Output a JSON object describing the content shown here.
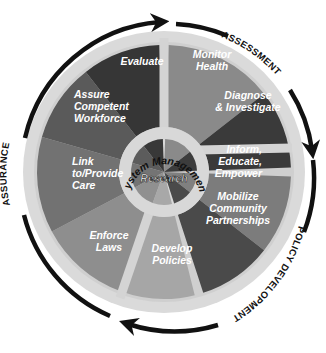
{
  "diagram": {
    "center_x": 164,
    "center_y": 172,
    "hub": {
      "inner_label": "Research",
      "ring_label": "System Management"
    },
    "phases": [
      {
        "name": "assessment",
        "label": "ASSESSMENT"
      },
      {
        "name": "policy-development",
        "label": "POLICY DEVELOPMENT"
      },
      {
        "name": "assurance",
        "label": "ASSURANCE"
      }
    ],
    "services": [
      {
        "id": "monitor-health",
        "lines": [
          "Monitor",
          "Health"
        ],
        "color": "#8a8a8a"
      },
      {
        "id": "diagnose-investigate",
        "lines": [
          "Diagnose",
          "& Investigate"
        ],
        "color": "#3a3a3a"
      },
      {
        "id": "inform-educate-empower",
        "lines": [
          "Inform,",
          "Educate,",
          "Empower"
        ],
        "color": "#7c7c7c"
      },
      {
        "id": "mobilize-community-partnerships",
        "lines": [
          "Mobilize",
          "Community",
          "Partnerships"
        ],
        "color": "#4a4a4a"
      },
      {
        "id": "develop-policies",
        "lines": [
          "Develop",
          "Policies"
        ],
        "color": "#a6a6a6"
      },
      {
        "id": "enforce-laws",
        "lines": [
          "Enforce",
          "Laws"
        ],
        "color": "#8e8e8e"
      },
      {
        "id": "link-provide-care",
        "lines": [
          "Link",
          "to/Provide",
          "Care"
        ],
        "color": "#727272"
      },
      {
        "id": "assure-competent-workforce",
        "lines": [
          "Assure",
          "Competent",
          "Workforce"
        ],
        "color": "#5a5a5a"
      },
      {
        "id": "evaluate",
        "lines": [
          "Evaluate"
        ],
        "color": "#363636"
      }
    ],
    "colors": {
      "outer_ring": "#d6d6d6",
      "spokes": "#d0d0d0",
      "arrows": "#111111",
      "label_text": "#ffffff"
    }
  }
}
